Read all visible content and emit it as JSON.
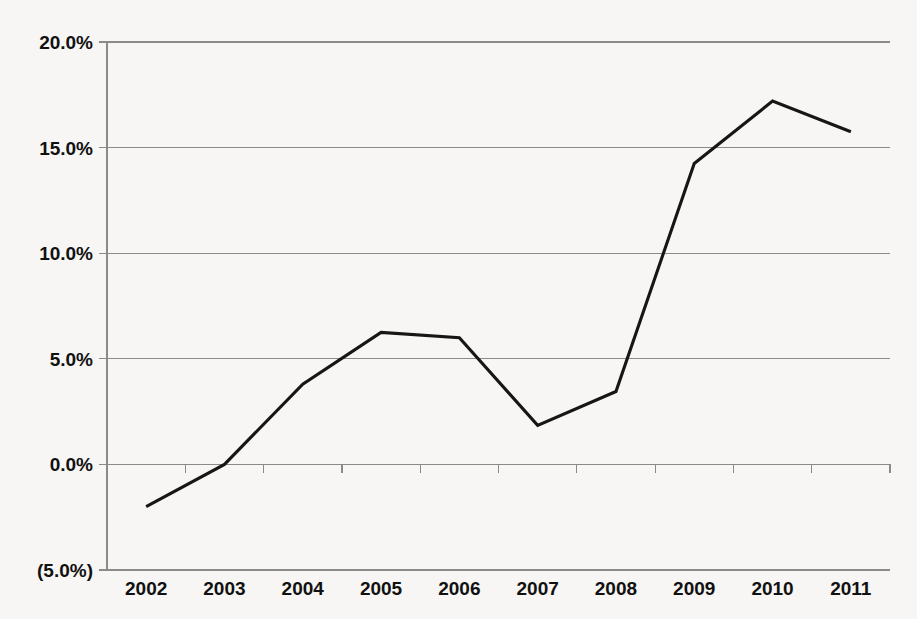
{
  "chart_data": {
    "type": "line",
    "title": "",
    "subtitle": "",
    "xlabel": "",
    "ylabel": "",
    "categories": [
      "2002",
      "2003",
      "2004",
      "2005",
      "2006",
      "2007",
      "2008",
      "2009",
      "2010",
      "2011"
    ],
    "series": [
      {
        "name": "",
        "values": [
          -2.0,
          0.0,
          3.8,
          6.25,
          6.0,
          1.85,
          3.45,
          14.25,
          17.2,
          15.75
        ]
      }
    ],
    "values": [
      -2.0,
      0.0,
      3.8,
      6.25,
      6.0,
      1.85,
      3.45,
      14.25,
      17.2,
      15.75
    ],
    "ylim": [
      -5.0,
      20.0
    ],
    "y_ticks": [
      -5.0,
      0.0,
      5.0,
      10.0,
      15.0,
      20.0
    ],
    "y_tick_labels": [
      "(5.0%)",
      "0.0%",
      "5.0%",
      "10.0%",
      "15.0%",
      "20.0%"
    ],
    "grid": true,
    "grid_axis": "y",
    "legend": false,
    "legend_position": "none",
    "line_color": "#161616",
    "grid_color": "#8a8a8a",
    "background_color": "#f7f6f4"
  },
  "axes": {
    "y_labels": [
      {
        "text": "20.0%",
        "value": 20.0
      },
      {
        "text": "15.0%",
        "value": 15.0
      },
      {
        "text": "10.0%",
        "value": 10.0
      },
      {
        "text": "5.0%",
        "value": 5.0
      },
      {
        "text": "0.0%",
        "value": 0.0
      },
      {
        "text": "(5.0%)",
        "value": -5.0
      }
    ],
    "x_labels": [
      {
        "text": "2002"
      },
      {
        "text": "2003"
      },
      {
        "text": "2004"
      },
      {
        "text": "2005"
      },
      {
        "text": "2006"
      },
      {
        "text": "2007"
      },
      {
        "text": "2008"
      },
      {
        "text": "2009"
      },
      {
        "text": "2010"
      },
      {
        "text": "2011"
      }
    ]
  }
}
